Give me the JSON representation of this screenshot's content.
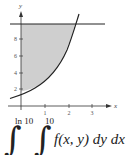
{
  "diagram": {
    "axis_labels": {
      "x": "x",
      "y": "y"
    },
    "y_ticks": [
      "2",
      "4",
      "6",
      "8"
    ],
    "x_ticks": [
      "1",
      "2",
      "3"
    ],
    "curve": "y = e^x",
    "horizontal_line": "y = 10",
    "shaded_region": "between y-axis, curve y = e^x and line y = 10",
    "colors": {
      "line": "#222222",
      "shade": "#cfcfcf"
    }
  },
  "integral": {
    "outer_upper": "ln 10",
    "inner_upper": "10",
    "integrand": "f(x, y) dy dx"
  }
}
